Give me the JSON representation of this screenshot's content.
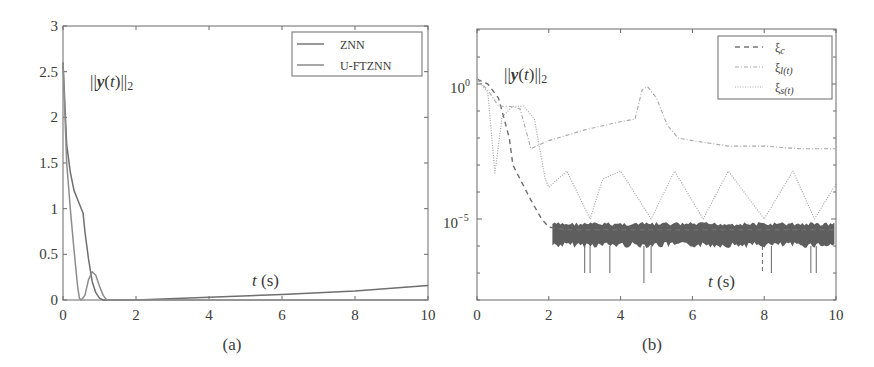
{
  "figure": {
    "panels": [
      "(a)",
      "(b)"
    ]
  },
  "chart_data": [
    {
      "type": "line",
      "panel_label": "(a)",
      "title": "",
      "annotation": "||y(t)||_2",
      "xlabel": "t (s)",
      "ylabel": "",
      "xlim": [
        0,
        10
      ],
      "ylim": [
        0,
        3
      ],
      "x_ticks": [
        "0",
        "2",
        "4",
        "6",
        "8",
        "10"
      ],
      "y_ticks": [
        "0",
        "0.5",
        "1",
        "1.5",
        "2",
        "2.5",
        "3"
      ],
      "grid": false,
      "legend_position": "upper right",
      "legend": [
        "ZNN",
        "U-FTZNN"
      ],
      "series": [
        {
          "name": "ZNN",
          "x": [
            0,
            0.1,
            0.2,
            0.3,
            0.4,
            0.5,
            0.55,
            0.6,
            0.7,
            0.8,
            0.9,
            1.0,
            1.1,
            1.2,
            2,
            4,
            6,
            8,
            10
          ],
          "y": [
            2.6,
            1.7,
            1.4,
            1.2,
            1.1,
            1.0,
            0.95,
            0.75,
            0.45,
            0.2,
            0.08,
            0.02,
            0.0,
            0.0,
            0.0,
            0.03,
            0.06,
            0.1,
            0.16
          ]
        },
        {
          "name": "U-FTZNN",
          "x": [
            0,
            0.1,
            0.2,
            0.3,
            0.4,
            0.45,
            0.5,
            0.6,
            0.7,
            0.8,
            0.9,
            1.0,
            1.1,
            1.2,
            2,
            4,
            6,
            8,
            10
          ],
          "y": [
            2.6,
            1.5,
            1.0,
            0.55,
            0.15,
            0.02,
            0.0,
            0.05,
            0.22,
            0.31,
            0.27,
            0.15,
            0.05,
            0.0,
            0.0,
            0.0,
            0.0,
            0.0,
            0.0
          ]
        }
      ]
    },
    {
      "type": "line",
      "panel_label": "(b)",
      "title": "",
      "annotation": "||y(t)||_2",
      "xlabel": "t (s)",
      "ylabel": "",
      "yscale": "log",
      "xlim": [
        0,
        10
      ],
      "ylim": [
        1e-08,
        100.0
      ],
      "x_ticks": [
        "0",
        "2",
        "4",
        "6",
        "8",
        "10"
      ],
      "y_ticks": [
        "10^0",
        "10^-5"
      ],
      "grid": false,
      "legend_position": "upper right",
      "legend": [
        "ξc",
        "ξl(t)",
        "ξs(t)"
      ],
      "series": [
        {
          "name": "ξc",
          "style": "dashed",
          "x": [
            0,
            0.3,
            0.6,
            0.9,
            1.0,
            1.2,
            1.5,
            1.8,
            2.0,
            2.5,
            3,
            4,
            5,
            6,
            7,
            8,
            9,
            10
          ],
          "y": [
            1.5,
            1.0,
            0.3,
            0.01,
            0.001,
            0.0003,
            5e-05,
            1e-05,
            5e-06,
            4e-06,
            4e-06,
            4e-06,
            4e-06,
            4e-06,
            4e-06,
            4e-06,
            4e-06,
            4e-06
          ]
        },
        {
          "name": "ξl(t)",
          "style": "dash-dot",
          "x": [
            0,
            0.3,
            0.6,
            0.9,
            1.2,
            1.5,
            2,
            3,
            4,
            4.4,
            4.6,
            4.75,
            5.0,
            5.3,
            5.6,
            6,
            7,
            8,
            9,
            10
          ],
          "y": [
            1.5,
            0.6,
            0.15,
            0.15,
            0.12,
            0.004,
            0.008,
            0.02,
            0.04,
            0.05,
            0.6,
            0.8,
            0.3,
            0.03,
            0.01,
            0.008,
            0.005,
            0.005,
            0.004,
            0.004
          ]
        },
        {
          "name": "ξs(t)",
          "style": "dotted",
          "x": [
            0,
            0.3,
            0.5,
            0.7,
            1.0,
            1.3,
            1.6,
            1.9,
            2.0,
            2.5,
            3.15,
            3.5,
            4.0,
            4.85,
            5.5,
            6.3,
            7.0,
            8.0,
            8.8,
            9.4,
            10
          ],
          "y": [
            1.5,
            0.5,
            0.0005,
            0.06,
            0.15,
            0.15,
            0.05,
            0.0003,
            0.00015,
            0.0006,
            1e-05,
            0.0003,
            0.0006,
            1e-05,
            0.0006,
            1e-05,
            0.0006,
            1e-05,
            0.0006,
            1e-05,
            0.0002
          ]
        }
      ],
      "noise_band": {
        "x_range": [
          2,
          10
        ],
        "y_range": [
          1e-06,
          1e-05
        ],
        "description": "dense oscillation region of ξc around 10^-5.5"
      }
    }
  ]
}
